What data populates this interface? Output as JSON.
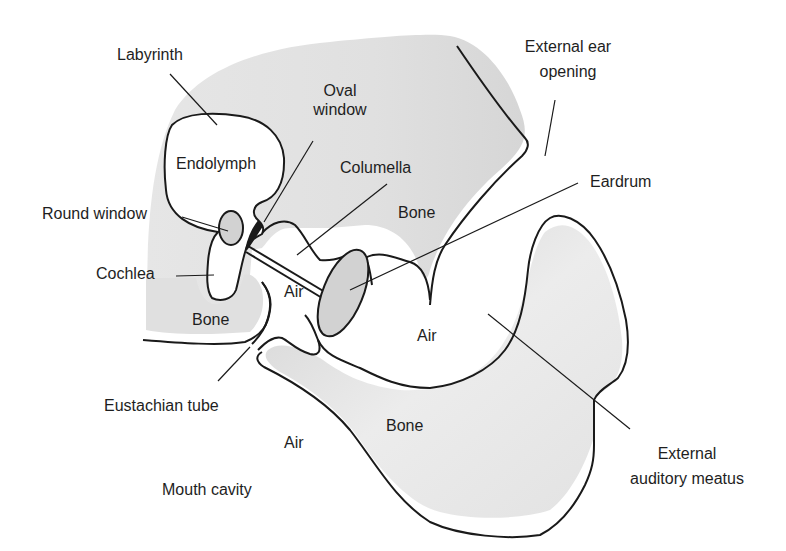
{
  "diagram": {
    "type": "anatomical-cross-section",
    "colors": {
      "outline": "#1a1a1a",
      "bone_fill": "#dcdcdc",
      "bone_fill_dark": "#cfcfcf",
      "bone_fill_light": "#ebebeb",
      "window_fill": "#d2d2d2",
      "background": "#ffffff",
      "text": "#1e1e1e"
    },
    "labels": {
      "labyrinth": "Labyrinth",
      "oval_window_line1": "Oval",
      "oval_window_line2": "window",
      "external_ear_opening_line1": "External ear",
      "external_ear_opening_line2": "opening",
      "endolymph": "Endolymph",
      "columella": "Columella",
      "eardrum": "Eardrum",
      "round_window": "Round window",
      "bone_upper": "Bone",
      "cochlea": "Cochlea",
      "air_middle": "Air",
      "bone_left": "Bone",
      "air_meatus": "Air",
      "eustachian_tube": "Eustachian tube",
      "bone_lower": "Bone",
      "air_mouth": "Air",
      "external_auditory_meatus_line1": "External",
      "external_auditory_meatus_line2": "auditory meatus",
      "mouth_cavity": "Mouth cavity"
    }
  }
}
